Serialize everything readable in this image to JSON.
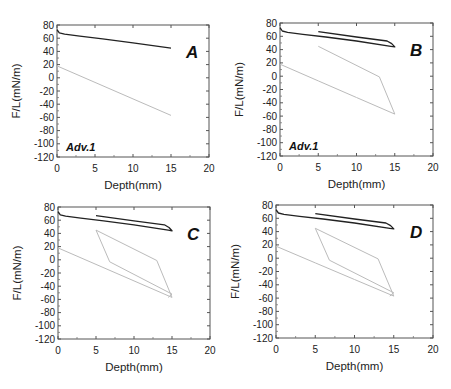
{
  "chart_data": [
    {
      "type": "line",
      "panel": "A",
      "annotation": "Adv.1",
      "xlabel": "Depth(mm)",
      "ylabel": "F/L(mN/m)",
      "xlim": [
        0,
        20
      ],
      "ylim": [
        -120,
        80
      ],
      "xticks": [
        0,
        5,
        10,
        15,
        20
      ],
      "yticks": [
        80,
        60,
        40,
        20,
        0,
        -20,
        -40,
        -60,
        -80,
        -100,
        -120
      ],
      "grid": false,
      "series": [
        {
          "name": "dark",
          "color": "#222222",
          "x": [
            0,
            0.3,
            1,
            3,
            6,
            10,
            15
          ],
          "y": [
            73,
            68,
            66,
            63,
            59,
            53,
            45
          ]
        },
        {
          "name": "light",
          "color": "#bbbbbb",
          "x": [
            0,
            5,
            10,
            15
          ],
          "y": [
            18,
            -7,
            -32,
            -57
          ]
        }
      ],
      "box": {
        "x": 57,
        "y": 25,
        "w": 152,
        "h": 132
      }
    },
    {
      "type": "line",
      "panel": "B",
      "annotation": "Adv.1",
      "xlabel": "Depth(mm)",
      "ylabel": "F/L(mN/m)",
      "xlim": [
        0,
        20
      ],
      "ylim": [
        -120,
        80
      ],
      "xticks": [
        0,
        5,
        10,
        15,
        20
      ],
      "yticks": [
        80,
        60,
        40,
        20,
        0,
        -20,
        -40,
        -60,
        -80,
        -100,
        -120
      ],
      "grid": false,
      "series": [
        {
          "name": "dark",
          "color": "#222222",
          "x": [
            0,
            0.3,
            1,
            3,
            6,
            10,
            14.5,
            15,
            14.6,
            14,
            10,
            5
          ],
          "y": [
            73,
            68,
            66,
            63,
            59,
            53,
            45,
            44,
            49,
            53,
            59,
            67
          ]
        },
        {
          "name": "light",
          "color": "#bbbbbb",
          "x": [
            0,
            5,
            10,
            15,
            13,
            5
          ],
          "y": [
            18,
            -7,
            -32,
            -57,
            -1,
            45
          ]
        }
      ],
      "box": {
        "x": 280,
        "y": 23,
        "w": 153,
        "h": 133
      }
    },
    {
      "type": "line",
      "panel": "C",
      "annotation": "",
      "xlabel": "Depth(mm)",
      "ylabel": "F/L(mN/m)",
      "xlim": [
        0,
        20
      ],
      "ylim": [
        -120,
        80
      ],
      "xticks": [
        0,
        5,
        10,
        15,
        20
      ],
      "yticks": [
        80,
        60,
        40,
        20,
        0,
        -20,
        -40,
        -60,
        -80,
        -100,
        -120
      ],
      "grid": false,
      "series": [
        {
          "name": "dark",
          "color": "#222222",
          "x": [
            0,
            0.3,
            1,
            3,
            6,
            10,
            14.5,
            15,
            14.6,
            14,
            10,
            5
          ],
          "y": [
            73,
            68,
            66,
            63,
            59,
            53,
            45,
            44,
            49,
            53,
            59,
            67
          ]
        },
        {
          "name": "light",
          "color": "#bbbbbb",
          "x": [
            0,
            5,
            10,
            15,
            13,
            5,
            6.8,
            15,
            14.5
          ],
          "y": [
            18,
            -7,
            -32,
            -57,
            -1,
            45,
            -3,
            -52,
            -57
          ]
        }
      ],
      "box": {
        "x": 58,
        "y": 207,
        "w": 152,
        "h": 132
      }
    },
    {
      "type": "line",
      "panel": "D",
      "annotation": "",
      "xlabel": "Depth(mm)",
      "ylabel": "F/L(mN/m)",
      "xlim": [
        0,
        20
      ],
      "ylim": [
        -120,
        80
      ],
      "xticks": [
        0,
        5,
        10,
        15,
        20
      ],
      "yticks": [
        80,
        60,
        40,
        20,
        0,
        -20,
        -40,
        -60,
        -80,
        -100,
        -120
      ],
      "grid": false,
      "series": [
        {
          "name": "dark",
          "color": "#222222",
          "x": [
            0,
            0.3,
            1,
            3,
            6,
            10,
            14.5,
            15,
            14.6,
            14,
            10,
            5
          ],
          "y": [
            73,
            68,
            66,
            63,
            59,
            53,
            45,
            44,
            49,
            53,
            59,
            67
          ]
        },
        {
          "name": "light",
          "color": "#bbbbbb",
          "x": [
            0,
            5,
            10,
            15,
            13,
            5,
            6.8,
            15,
            14.5
          ],
          "y": [
            18,
            -7,
            -32,
            -57,
            -1,
            45,
            -3,
            -52,
            -57
          ]
        }
      ],
      "box": {
        "x": 276,
        "y": 205,
        "w": 157,
        "h": 133
      }
    }
  ]
}
